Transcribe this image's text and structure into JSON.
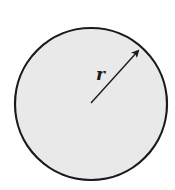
{
  "diagram": {
    "type": "circle-with-radius",
    "label": "r",
    "colors": {
      "fill": "#e9e9e9",
      "stroke": "#1a1a1a",
      "background": "#ffffff"
    }
  }
}
